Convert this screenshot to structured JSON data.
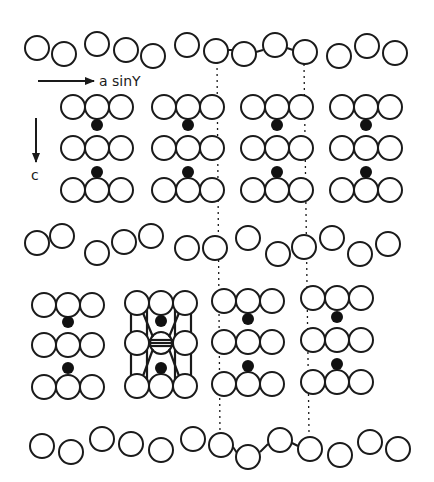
{
  "figure": {
    "colors": {
      "stroke": "#1a1a1a",
      "fill_atom": "#ffffff",
      "interstitial": "#111111",
      "background": "#ffffff"
    },
    "axes": {
      "horizontal": {
        "label": "a sinY",
        "arrow": {
          "x1": 38,
          "y1": 81,
          "x2": 94,
          "y2": 81
        },
        "label_pos": [
          99,
          86
        ]
      },
      "vertical": {
        "label": "c",
        "arrow": {
          "x1": 36,
          "y1": 118,
          "x2": 36,
          "y2": 162
        },
        "label_pos": [
          31,
          180
        ]
      }
    },
    "atom_radius": 12,
    "layer_rows": [
      {
        "name": "top-layer",
        "atoms": [
          [
            37,
            48
          ],
          [
            64,
            54
          ],
          [
            97,
            44
          ],
          [
            126,
            50
          ],
          [
            153,
            56
          ],
          [
            187,
            45
          ],
          [
            216,
            51
          ],
          [
            244,
            54
          ],
          [
            275,
            45
          ],
          [
            305,
            52
          ],
          [
            339,
            56
          ],
          [
            367,
            46
          ],
          [
            395,
            53
          ]
        ]
      },
      {
        "name": "middle-layer",
        "atoms": [
          [
            37,
            243
          ],
          [
            62,
            236
          ],
          [
            97,
            253
          ],
          [
            124,
            242
          ],
          [
            151,
            236
          ],
          [
            187,
            248
          ],
          [
            215,
            248
          ],
          [
            248,
            238
          ],
          [
            278,
            254
          ],
          [
            304,
            247
          ],
          [
            332,
            238
          ],
          [
            360,
            254
          ],
          [
            388,
            244
          ]
        ]
      },
      {
        "name": "bottom-layer",
        "atoms": [
          [
            42,
            446
          ],
          [
            71,
            452
          ],
          [
            102,
            439
          ],
          [
            131,
            444
          ],
          [
            161,
            450
          ],
          [
            193,
            439
          ],
          [
            221,
            445
          ],
          [
            248,
            457
          ],
          [
            280,
            440
          ],
          [
            310,
            449
          ],
          [
            340,
            455
          ],
          [
            370,
            442
          ],
          [
            398,
            449
          ]
        ]
      }
    ],
    "groups": [
      {
        "name": "group-upper-1",
        "cx": 97,
        "rows_y": [
          107,
          148,
          190
        ],
        "dots_y": [
          125,
          172
        ],
        "highlighted": false
      },
      {
        "name": "group-upper-2",
        "cx": 188,
        "rows_y": [
          107,
          148,
          190
        ],
        "dots_y": [
          125,
          172
        ],
        "highlighted": false
      },
      {
        "name": "group-upper-3",
        "cx": 277,
        "rows_y": [
          107,
          148,
          190
        ],
        "dots_y": [
          125,
          172
        ],
        "highlighted": false
      },
      {
        "name": "group-upper-4",
        "cx": 366,
        "rows_y": [
          107,
          148,
          190
        ],
        "dots_y": [
          125,
          172
        ],
        "highlighted": false
      },
      {
        "name": "group-lower-1",
        "cx": 68,
        "rows_y": [
          305,
          345,
          387
        ],
        "dots_y": [
          322,
          368
        ],
        "highlighted": false
      },
      {
        "name": "group-lower-2",
        "cx": 161,
        "rows_y": [
          303,
          343,
          386
        ],
        "dots_y": [
          321,
          368
        ],
        "highlighted": true
      },
      {
        "name": "group-lower-3",
        "cx": 248,
        "rows_y": [
          301,
          342,
          384
        ],
        "dots_y": [
          319,
          366
        ],
        "highlighted": false
      },
      {
        "name": "group-lower-4",
        "cx": 337,
        "rows_y": [
          298,
          340,
          382
        ],
        "dots_y": [
          317,
          364
        ],
        "highlighted": false
      }
    ],
    "dotted_lines": [
      {
        "name": "unit-cell-edge-left",
        "x1": 217,
        "y1": 62,
        "x2": 220,
        "y2": 436
      },
      {
        "name": "unit-cell-edge-right",
        "x1": 304,
        "y1": 64,
        "x2": 309,
        "y2": 432
      }
    ],
    "bonds": [
      {
        "x1": 228,
        "y1": 50,
        "x2": 233,
        "y2": 50
      },
      {
        "x1": 256,
        "y1": 52,
        "x2": 263,
        "y2": 50
      },
      {
        "x1": 287,
        "y1": 48,
        "x2": 293,
        "y2": 50
      },
      {
        "x1": 233,
        "y1": 447,
        "x2": 237,
        "y2": 453
      },
      {
        "x1": 260,
        "y1": 452,
        "x2": 268,
        "y2": 444
      },
      {
        "x1": 292,
        "y1": 443,
        "x2": 298,
        "y2": 446
      }
    ]
  }
}
